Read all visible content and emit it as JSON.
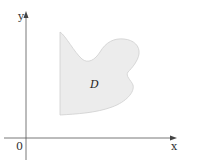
{
  "diagram": {
    "region_label": "D",
    "x_axis_label": "x",
    "y_axis_label": "y",
    "origin_label": "0",
    "colors": {
      "region_fill": "#ececec",
      "region_stroke": "#c8c8c8",
      "axis": "#555555"
    }
  }
}
